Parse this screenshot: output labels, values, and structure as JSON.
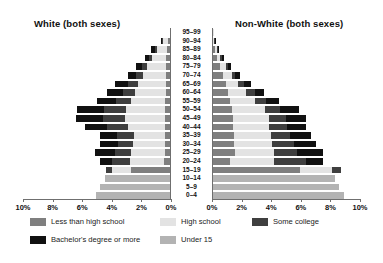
{
  "chart_data": {
    "type": "bar",
    "subtype": "population-pyramid-stacked",
    "title": "",
    "xlabel": "",
    "ylabel": "",
    "left_panel_title": "White (both sexes)",
    "right_panel_title": "Non-White (both sexes)",
    "xlim": [
      0,
      10
    ],
    "xunit": "%",
    "xticks": [
      10,
      8,
      6,
      4,
      2,
      0
    ],
    "xticklabels_left": [
      "10%",
      "8%",
      "6%",
      "4%",
      "2%",
      "0%"
    ],
    "xticklabels_right": [
      "0%",
      "2%",
      "4%",
      "6%",
      "8%",
      "10%"
    ],
    "grid": false,
    "legend_position": "bottom",
    "categories": [
      "95–99",
      "90–94",
      "85–89",
      "80–84",
      "75–79",
      "70–74",
      "65–69",
      "60–64",
      "55–59",
      "50–54",
      "45–49",
      "40–44",
      "35–39",
      "30–34",
      "25–29",
      "20–24",
      "15–19",
      "10–14",
      "5–9",
      "0–4"
    ],
    "series_names": [
      "Less than high school",
      "High school",
      "Some college",
      "Bachelor's degree or more",
      "Under 15"
    ],
    "series_colors": {
      "Less than high school": "#7f7f7f",
      "High school": "#e3e3e3",
      "Some college": "#3f3f3f",
      "Bachelor's degree or more": "#111111",
      "Under 15": "#b3b3b3"
    },
    "left_panel": {
      "name": "White (both sexes)",
      "stacks": [
        {
          "age": "95–99",
          "Less than high school": 0.05,
          "High school": 0.04,
          "Some college": 0.0,
          "Bachelor's degree or more": 0.0,
          "Under 15": 0
        },
        {
          "age": "90–94",
          "Less than high school": 0.22,
          "High school": 0.3,
          "Some college": 0.08,
          "Bachelor's degree or more": 0.1,
          "Under 15": 0
        },
        {
          "age": "85–89",
          "Less than high school": 0.3,
          "High school": 0.62,
          "Some college": 0.16,
          "Bachelor's degree or more": 0.24,
          "Under 15": 0
        },
        {
          "age": "80–84",
          "Less than high school": 0.32,
          "High school": 0.94,
          "Some college": 0.22,
          "Bachelor's degree or more": 0.3,
          "Under 15": 0
        },
        {
          "age": "75–79",
          "Less than high school": 0.34,
          "High school": 1.28,
          "Some college": 0.34,
          "Bachelor's degree or more": 0.44,
          "Under 15": 0
        },
        {
          "age": "70–74",
          "Less than high school": 0.34,
          "High school": 1.54,
          "Some college": 0.46,
          "Bachelor's degree or more": 0.6,
          "Under 15": 0
        },
        {
          "age": "65–69",
          "Less than high school": 0.36,
          "High school": 1.86,
          "Some college": 0.66,
          "Bachelor's degree or more": 0.88,
          "Under 15": 0
        },
        {
          "age": "60–64",
          "Less than high school": 0.36,
          "High school": 2.06,
          "Some college": 0.84,
          "Bachelor's degree or more": 1.06,
          "Under 15": 0
        },
        {
          "age": "55–59",
          "Less than high school": 0.38,
          "High school": 2.32,
          "Some college": 1.04,
          "Bachelor's degree or more": 1.28,
          "Under 15": 0
        },
        {
          "age": "50–54",
          "Less than high school": 0.4,
          "High school": 2.66,
          "Some college": 1.44,
          "Bachelor's degree or more": 1.82,
          "Under 15": 0
        },
        {
          "age": "45–49",
          "Less than high school": 0.42,
          "High school": 2.7,
          "Some college": 1.5,
          "Bachelor's degree or more": 1.82,
          "Under 15": 0
        },
        {
          "age": "40–44",
          "Less than high school": 0.42,
          "High school": 2.48,
          "Some college": 1.4,
          "Bachelor's degree or more": 1.54,
          "Under 15": 0
        },
        {
          "age": "35–39",
          "Less than high school": 0.42,
          "High school": 2.1,
          "Some college": 1.1,
          "Bachelor's degree or more": 1.16,
          "Under 15": 0
        },
        {
          "age": "30–34",
          "Less than high school": 0.42,
          "High school": 2.12,
          "Some college": 1.04,
          "Bachelor's degree or more": 1.22,
          "Under 15": 0
        },
        {
          "age": "25–29",
          "Less than high school": 0.44,
          "High school": 2.26,
          "Some college": 1.1,
          "Bachelor's degree or more": 1.32,
          "Under 15": 0
        },
        {
          "age": "20–24",
          "Less than high school": 0.46,
          "High school": 2.32,
          "Some college": 1.22,
          "Bachelor's degree or more": 0.82,
          "Under 15": 0
        },
        {
          "age": "15–19",
          "Less than high school": 2.72,
          "High school": 1.3,
          "Some college": 0.34,
          "Bachelor's degree or more": 0.0,
          "Under 15": 0
        },
        {
          "age": "10–14",
          "Less than high school": 0.0,
          "High school": 0.0,
          "Some college": 0.0,
          "Bachelor's degree or more": 0.0,
          "Under 15": 4.46
        },
        {
          "age": "5–9",
          "Less than high school": 0.0,
          "High school": 0.0,
          "Some college": 0.0,
          "Bachelor's degree or more": 0.0,
          "Under 15": 4.78
        },
        {
          "age": "0–4",
          "Less than high school": 0.0,
          "High school": 0.0,
          "Some college": 0.0,
          "Bachelor's degree or more": 0.0,
          "Under 15": 5.1
        }
      ]
    },
    "right_panel": {
      "name": "Non-White (both sexes)",
      "stacks": [
        {
          "age": "95–99",
          "Less than high school": 0.04,
          "High school": 0.03,
          "Some college": 0.0,
          "Bachelor's degree or more": 0.0,
          "Under 15": 0
        },
        {
          "age": "90–94",
          "Less than high school": 0.1,
          "High school": 0.06,
          "Some college": 0.03,
          "Bachelor's degree or more": 0.03,
          "Under 15": 0
        },
        {
          "age": "85–89",
          "Less than high school": 0.22,
          "High school": 0.1,
          "Some college": 0.06,
          "Bachelor's degree or more": 0.06,
          "Under 15": 0
        },
        {
          "age": "80–84",
          "Less than high school": 0.34,
          "High school": 0.22,
          "Some college": 0.1,
          "Bachelor's degree or more": 0.12,
          "Under 15": 0
        },
        {
          "age": "75–79",
          "Less than high school": 0.54,
          "High school": 0.38,
          "Some college": 0.16,
          "Bachelor's degree or more": 0.2,
          "Under 15": 0
        },
        {
          "age": "70–74",
          "Less than high school": 0.74,
          "High school": 0.58,
          "Some college": 0.26,
          "Bachelor's degree or more": 0.32,
          "Under 15": 0
        },
        {
          "age": "65–69",
          "Less than high school": 0.92,
          "High school": 0.86,
          "Some college": 0.4,
          "Bachelor's degree or more": 0.46,
          "Under 15": 0
        },
        {
          "age": "60–64",
          "Less than high school": 1.1,
          "High school": 1.22,
          "Some college": 0.56,
          "Bachelor's degree or more": 0.66,
          "Under 15": 0
        },
        {
          "age": "55–59",
          "Less than high school": 1.24,
          "High school": 1.66,
          "Some college": 0.76,
          "Bachelor's degree or more": 0.88,
          "Under 15": 0
        },
        {
          "age": "50–54",
          "Less than high school": 1.34,
          "High school": 2.22,
          "Some college": 1.06,
          "Bachelor's degree or more": 1.26,
          "Under 15": 0
        },
        {
          "age": "45–49",
          "Less than high school": 1.42,
          "High school": 2.42,
          "Some college": 1.16,
          "Bachelor's degree or more": 1.34,
          "Under 15": 0
        },
        {
          "age": "40–44",
          "Less than high school": 1.44,
          "High school": 2.42,
          "Some college": 1.2,
          "Bachelor's degree or more": 1.32,
          "Under 15": 0
        },
        {
          "age": "35–39",
          "Less than high school": 1.5,
          "High school": 2.46,
          "Some college": 1.32,
          "Bachelor's degree or more": 1.38,
          "Under 15": 0
        },
        {
          "age": "30–34",
          "Less than high school": 1.52,
          "High school": 2.56,
          "Some college": 1.44,
          "Bachelor's degree or more": 1.48,
          "Under 15": 0
        },
        {
          "age": "25–29",
          "Less than high school": 1.58,
          "High school": 2.58,
          "Some college": 1.58,
          "Bachelor's degree or more": 1.78,
          "Under 15": 0
        },
        {
          "age": "20–24",
          "Less than high school": 1.2,
          "High school": 3.02,
          "Some college": 2.12,
          "Bachelor's degree or more": 1.16,
          "Under 15": 0
        },
        {
          "age": "15–19",
          "Less than high school": 5.94,
          "High school": 2.16,
          "Some college": 0.62,
          "Bachelor's degree or more": 0.0,
          "Under 15": 0
        },
        {
          "age": "10–14",
          "Less than high school": 0.0,
          "High school": 0.0,
          "Some college": 0.0,
          "Bachelor's degree or more": 0.0,
          "Under 15": 8.34
        },
        {
          "age": "5–9",
          "Less than high school": 0.0,
          "High school": 0.0,
          "Some college": 0.0,
          "Bachelor's degree or more": 0.0,
          "Under 15": 8.56
        },
        {
          "age": "0–4",
          "Less than high school": 0.0,
          "High school": 0.0,
          "Some college": 0.0,
          "Bachelor's degree or more": 0.0,
          "Under 15": 8.94
        }
      ]
    },
    "legend": [
      {
        "label": "Less than high school",
        "color": "#7f7f7f"
      },
      {
        "label": "High school",
        "color": "#e3e3e3"
      },
      {
        "label": "Some college",
        "color": "#3f3f3f"
      },
      {
        "label": "Bachelor's degree or more",
        "color": "#111111"
      },
      {
        "label": "Under 15",
        "color": "#b3b3b3"
      }
    ]
  }
}
